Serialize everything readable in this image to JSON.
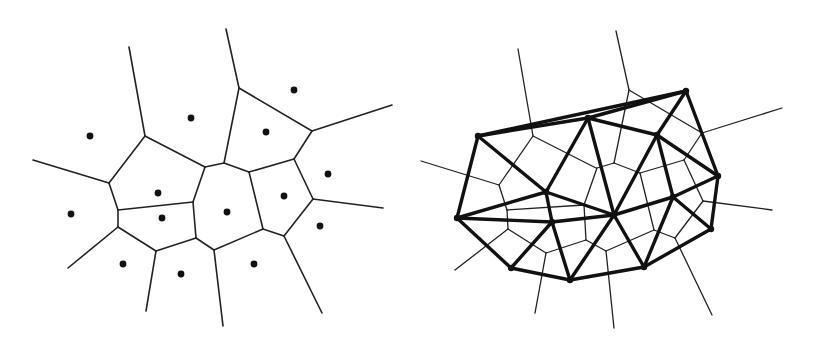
{
  "figure": {
    "panels": [
      {
        "id": "voronoi",
        "description": "Voronoi diagram with generating sites",
        "colors": {
          "edge": "#222222",
          "site": "#111111",
          "background": "#ffffff"
        },
        "sites": [
          [
            90,
            136
          ],
          [
            191,
            118
          ],
          [
            294,
            90
          ],
          [
            266,
            132
          ],
          [
            158,
            193
          ],
          [
            162,
            218
          ],
          [
            71,
            214
          ],
          [
            227,
            212
          ],
          [
            284,
            196
          ],
          [
            328,
            174
          ],
          [
            320,
            226
          ],
          [
            123,
            264
          ],
          [
            181,
            274
          ],
          [
            254,
            264
          ]
        ],
        "edges": [
          [
            [
              129,
              47
            ],
            [
              145,
              136
            ]
          ],
          [
            [
              33,
              160
            ],
            [
              109,
              183
            ]
          ],
          [
            [
              145,
              136
            ],
            [
              205,
              167
            ]
          ],
          [
            [
              145,
              136
            ],
            [
              109,
              183
            ]
          ],
          [
            [
              109,
              183
            ],
            [
              118,
              210
            ]
          ],
          [
            [
              118,
              210
            ],
            [
              193,
              202
            ]
          ],
          [
            [
              118,
              210
            ],
            [
              118,
              227
            ]
          ],
          [
            [
              118,
              227
            ],
            [
              68,
              268
            ]
          ],
          [
            [
              118,
              227
            ],
            [
              156,
              251
            ]
          ],
          [
            [
              156,
              251
            ],
            [
              196,
              238
            ]
          ],
          [
            [
              156,
              251
            ],
            [
              146,
              311
            ]
          ],
          [
            [
              193,
              202
            ],
            [
              196,
              238
            ]
          ],
          [
            [
              193,
              202
            ],
            [
              205,
              167
            ]
          ],
          [
            [
              205,
              167
            ],
            [
              224,
              163
            ]
          ],
          [
            [
              224,
              163
            ],
            [
              239,
              88
            ]
          ],
          [
            [
              239,
              88
            ],
            [
              226,
              29
            ]
          ],
          [
            [
              239,
              88
            ],
            [
              312,
              131
            ]
          ],
          [
            [
              312,
              131
            ],
            [
              392,
              105
            ]
          ],
          [
            [
              312,
              131
            ],
            [
              294,
              159
            ]
          ],
          [
            [
              294,
              159
            ],
            [
              249,
              172
            ]
          ],
          [
            [
              249,
              172
            ],
            [
              224,
              163
            ]
          ],
          [
            [
              249,
              172
            ],
            [
              263,
              229
            ]
          ],
          [
            [
              294,
              159
            ],
            [
              313,
              199
            ]
          ],
          [
            [
              313,
              199
            ],
            [
              383,
              208
            ]
          ],
          [
            [
              313,
              199
            ],
            [
              284,
              236
            ]
          ],
          [
            [
              284,
              236
            ],
            [
              263,
              229
            ]
          ],
          [
            [
              284,
              236
            ],
            [
              322,
              313
            ]
          ],
          [
            [
              263,
              229
            ],
            [
              214,
              250
            ]
          ],
          [
            [
              214,
              250
            ],
            [
              196,
              238
            ]
          ],
          [
            [
              214,
              250
            ],
            [
              223,
              326
            ]
          ]
        ]
      },
      {
        "id": "voronoi-delaunay",
        "description": "Voronoi diagram overlaid with its Delaunay triangulation",
        "colors": {
          "voronoi_edge": "#222222",
          "delaunay_edge": "#111111",
          "background": "#ffffff"
        },
        "delaunay_nodes": {
          "a": [
            478,
            136
          ],
          "b": [
            588,
            118
          ],
          "c": [
            686,
            91
          ],
          "d": [
            657,
            135
          ],
          "e": [
            718,
            176
          ],
          "f": [
            457,
            218
          ],
          "g": [
            546,
            192
          ],
          "h": [
            552,
            222
          ],
          "i": [
            614,
            215
          ],
          "j": [
            673,
            197
          ],
          "k": [
            711,
            229
          ],
          "l": [
            511,
            268
          ],
          "m": [
            570,
            280
          ],
          "n": [
            644,
            267
          ]
        },
        "delaunay_edges": [
          [
            "a",
            "c"
          ],
          [
            "a",
            "b"
          ],
          [
            "b",
            "c"
          ],
          [
            "a",
            "f"
          ],
          [
            "a",
            "g"
          ],
          [
            "b",
            "g"
          ],
          [
            "b",
            "i"
          ],
          [
            "b",
            "d"
          ],
          [
            "c",
            "d"
          ],
          [
            "c",
            "e"
          ],
          [
            "d",
            "e"
          ],
          [
            "d",
            "i"
          ],
          [
            "d",
            "j"
          ],
          [
            "e",
            "j"
          ],
          [
            "e",
            "k"
          ],
          [
            "f",
            "g"
          ],
          [
            "f",
            "h"
          ],
          [
            "f",
            "l"
          ],
          [
            "g",
            "h"
          ],
          [
            "g",
            "i"
          ],
          [
            "h",
            "i"
          ],
          [
            "h",
            "l"
          ],
          [
            "h",
            "m"
          ],
          [
            "i",
            "m"
          ],
          [
            "i",
            "n"
          ],
          [
            "i",
            "j"
          ],
          [
            "j",
            "n"
          ],
          [
            "j",
            "k"
          ],
          [
            "k",
            "n"
          ],
          [
            "l",
            "m"
          ],
          [
            "m",
            "n"
          ]
        ],
        "voronoi_edges": [
          [
            [
              518,
              49
            ],
            [
              533,
              136
            ]
          ],
          [
            [
              421,
              161
            ],
            [
              499,
              185
            ]
          ],
          [
            [
              533,
              136
            ],
            [
              596,
              168
            ]
          ],
          [
            [
              533,
              136
            ],
            [
              499,
              185
            ]
          ],
          [
            [
              499,
              185
            ],
            [
              507,
              210
            ]
          ],
          [
            [
              507,
              210
            ],
            [
              584,
              205
            ]
          ],
          [
            [
              507,
              210
            ],
            [
              508,
              229
            ]
          ],
          [
            [
              508,
              229
            ],
            [
              455,
              270
            ]
          ],
          [
            [
              508,
              229
            ],
            [
              546,
              253
            ]
          ],
          [
            [
              546,
              253
            ],
            [
              586,
              240
            ]
          ],
          [
            [
              546,
              253
            ],
            [
              535,
              313
            ]
          ],
          [
            [
              584,
              205
            ],
            [
              586,
              240
            ]
          ],
          [
            [
              584,
              205
            ],
            [
              597,
              168
            ]
          ],
          [
            [
              597,
              168
            ],
            [
              614,
              163
            ]
          ],
          [
            [
              614,
              163
            ],
            [
              629,
              90
            ]
          ],
          [
            [
              629,
              90
            ],
            [
              616,
              31
            ]
          ],
          [
            [
              629,
              90
            ],
            [
              702,
              133
            ]
          ],
          [
            [
              702,
              133
            ],
            [
              782,
              108
            ]
          ],
          [
            [
              702,
              133
            ],
            [
              684,
              160
            ]
          ],
          [
            [
              684,
              160
            ],
            [
              640,
              173
            ]
          ],
          [
            [
              640,
              173
            ],
            [
              614,
              163
            ]
          ],
          [
            [
              640,
              173
            ],
            [
              654,
              230
            ]
          ],
          [
            [
              684,
              160
            ],
            [
              703,
              201
            ]
          ],
          [
            [
              703,
              201
            ],
            [
              772,
              210
            ]
          ],
          [
            [
              703,
              201
            ],
            [
              675,
              238
            ]
          ],
          [
            [
              675,
              238
            ],
            [
              654,
              230
            ]
          ],
          [
            [
              675,
              238
            ],
            [
              712,
              315
            ]
          ],
          [
            [
              654,
              230
            ],
            [
              606,
              251
            ]
          ],
          [
            [
              606,
              251
            ],
            [
              586,
              240
            ]
          ],
          [
            [
              606,
              251
            ],
            [
              614,
              328
            ]
          ]
        ]
      }
    ]
  }
}
